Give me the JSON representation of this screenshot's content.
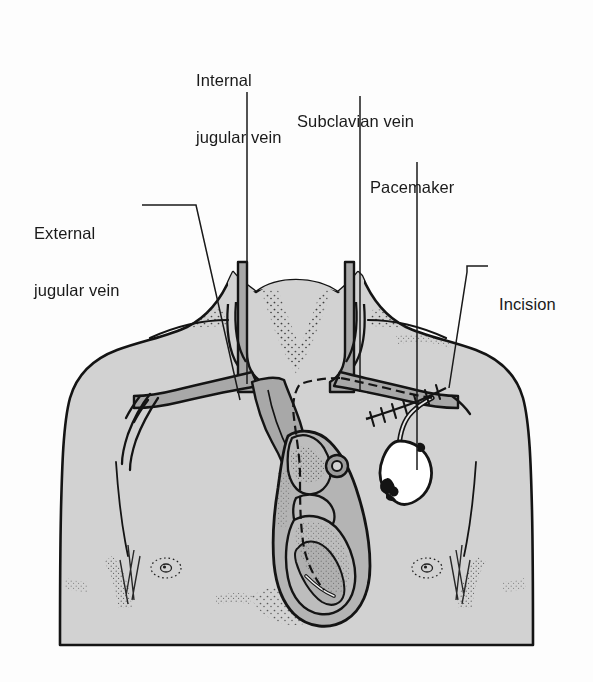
{
  "figure": {
    "background_color": "#fdfdfd",
    "ink_color": "#1a1a1a",
    "skin_fill": "#d2d2d2",
    "vessel_fill": "#a8a8a8",
    "heart_fill": "#b4b4b4",
    "device_fill": "#ffffff"
  },
  "labels": [
    {
      "id": "internal-jugular-vein",
      "line1": "Internal",
      "line2": "jugular vein",
      "x": 196,
      "y": 33
    },
    {
      "id": "subclavian-vein",
      "line1": "Subclavian vein",
      "line2": "",
      "x": 297,
      "y": 74
    },
    {
      "id": "pacemaker",
      "line1": "Pacemaker",
      "line2": "",
      "x": 370,
      "y": 140
    },
    {
      "id": "external-jugular-vein",
      "line1": "External",
      "line2": "jugular vein",
      "x": 34,
      "y": 186
    },
    {
      "id": "incision",
      "line1": "Incision",
      "line2": "",
      "x": 499,
      "y": 257
    }
  ],
  "anatomy_parts": [
    "neck",
    "left-shoulder",
    "right-shoulder",
    "chest",
    "left-nipple",
    "right-nipple",
    "internal-jugular-vein-left",
    "internal-jugular-vein-right",
    "external-jugular-vein",
    "subclavian-vein-left",
    "subclavian-vein-right",
    "brachiocephalic-vein",
    "superior-vena-cava",
    "heart",
    "pacemaker-generator",
    "pacemaker-lead",
    "incision-sutures"
  ]
}
